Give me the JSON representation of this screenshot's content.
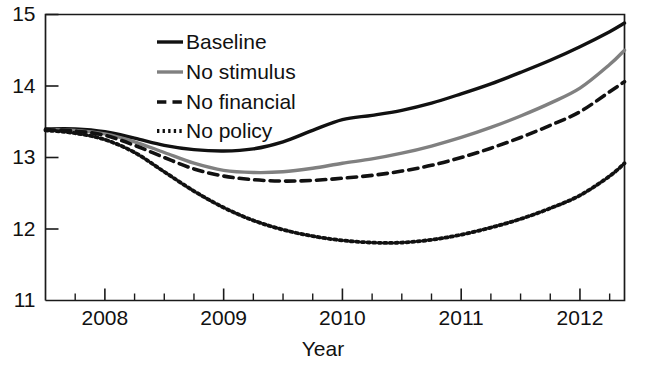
{
  "chart_data": {
    "type": "line",
    "title": "",
    "xlabel": "Year",
    "ylabel": "",
    "xlim": [
      2007.5,
      2012.375
    ],
    "ylim": [
      11,
      15
    ],
    "grid": false,
    "legend_position": "top-center-left",
    "x_tick_labels": [
      "2008",
      "2009",
      "2010",
      "2011",
      "2012"
    ],
    "x_tick_values": [
      2008,
      2009,
      2010,
      2011,
      2012
    ],
    "x_minor_tick_step": 0.25,
    "y_tick_labels": [
      "11",
      "12",
      "13",
      "14",
      "15"
    ],
    "y_tick_values": [
      11,
      12,
      13,
      14,
      15
    ],
    "x": [
      2007.5,
      2007.75,
      2008.0,
      2008.25,
      2008.5,
      2008.75,
      2009.0,
      2009.25,
      2009.5,
      2009.75,
      2010.0,
      2010.25,
      2010.5,
      2010.75,
      2011.0,
      2011.25,
      2011.5,
      2011.75,
      2012.0,
      2012.25,
      2012.375
    ],
    "series": [
      {
        "name": "Baseline",
        "style": "solid",
        "color": "#111111",
        "width": 3.4,
        "values": [
          13.4,
          13.4,
          13.36,
          13.27,
          13.17,
          13.11,
          13.09,
          13.12,
          13.22,
          13.38,
          13.53,
          13.59,
          13.66,
          13.76,
          13.89,
          14.03,
          14.19,
          14.36,
          14.55,
          14.76,
          14.88
        ]
      },
      {
        "name": "No stimulus",
        "style": "solid",
        "color": "#808080",
        "width": 3.4,
        "values": [
          13.39,
          13.38,
          13.33,
          13.22,
          13.07,
          12.92,
          12.82,
          12.79,
          12.8,
          12.85,
          12.92,
          12.98,
          13.06,
          13.16,
          13.28,
          13.42,
          13.58,
          13.76,
          13.97,
          14.3,
          14.5
        ]
      },
      {
        "name": "No financial",
        "style": "dashed",
        "color": "#111111",
        "width": 3.6,
        "values": [
          13.39,
          13.37,
          13.31,
          13.17,
          13.0,
          12.84,
          12.74,
          12.69,
          12.67,
          12.68,
          12.71,
          12.75,
          12.81,
          12.89,
          13.0,
          13.13,
          13.28,
          13.45,
          13.64,
          13.92,
          14.06
        ]
      },
      {
        "name": "No policy",
        "style": "dotted",
        "color": "#111111",
        "width": 3.8,
        "values": [
          13.38,
          13.34,
          13.25,
          13.07,
          12.8,
          12.53,
          12.3,
          12.12,
          11.99,
          11.9,
          11.84,
          11.81,
          11.81,
          11.85,
          11.92,
          12.02,
          12.14,
          12.29,
          12.47,
          12.74,
          12.92
        ]
      }
    ]
  },
  "legend": {
    "items": [
      {
        "label": "Baseline"
      },
      {
        "label": "No stimulus"
      },
      {
        "label": "No financial"
      },
      {
        "label": "No policy"
      }
    ]
  },
  "axes": {
    "x_title": "Year"
  }
}
